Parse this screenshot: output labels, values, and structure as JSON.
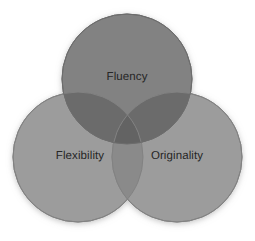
{
  "diagram": {
    "type": "venn",
    "title": "",
    "background_color": "#ffffff",
    "canvas": {
      "width": 255,
      "height": 241
    },
    "label_color": "#262626",
    "shadow_color": "#b4b4b4",
    "sets": [
      {
        "id": "fluency",
        "label": "Fluency",
        "fill_color": "#828282",
        "stroke_color": "#6f6f6f",
        "cx": 127,
        "cy": 79,
        "r": 65,
        "label_x": 127,
        "label_y": 78,
        "position": "top"
      },
      {
        "id": "flexibility",
        "label": "Flexibility",
        "fill_color": "#9c9c9c",
        "stroke_color": "#858585",
        "cx": 78,
        "cy": 157,
        "r": 65,
        "label_x": 80,
        "label_y": 157,
        "position": "bottom-left"
      },
      {
        "id": "originality",
        "label": "Originality",
        "fill_color": "#9c9c9c",
        "stroke_color": "#858585",
        "cx": 177,
        "cy": 157,
        "r": 65,
        "label_x": 177,
        "label_y": 157,
        "position": "bottom-right"
      }
    ],
    "overlaps": [
      {
        "id": "fluency-flexibility",
        "sets": [
          "fluency",
          "flexibility"
        ],
        "shade_color": "#6b6b6b"
      },
      {
        "id": "fluency-originality",
        "sets": [
          "fluency",
          "originality"
        ],
        "shade_color": "#6b6b6b"
      },
      {
        "id": "flexibility-originality",
        "sets": [
          "flexibility",
          "originality"
        ],
        "shade_color": "#8a8a8a"
      },
      {
        "id": "fluency-flexibility-originality",
        "sets": [
          "fluency",
          "flexibility",
          "originality"
        ],
        "shade_color": "#636363"
      }
    ]
  }
}
